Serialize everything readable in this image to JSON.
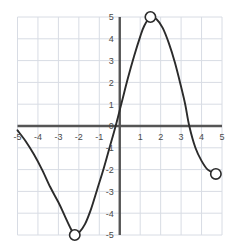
{
  "chart_data": {
    "type": "line",
    "title": "",
    "xlabel": "",
    "ylabel": "",
    "xlim": [
      -5,
      5
    ],
    "ylim": [
      -5,
      5
    ],
    "grid": true,
    "legend": null,
    "x_ticks": [
      -5,
      -4,
      -3,
      -2,
      -1,
      0,
      1,
      2,
      3,
      4,
      5
    ],
    "x_tick_labels": [
      "-5",
      "-4",
      "-3",
      "-2",
      "-1",
      "0",
      "1",
      "2",
      "3",
      "4",
      "5"
    ],
    "y_ticks": [
      -5,
      -4,
      -3,
      -2,
      -1,
      0,
      1,
      2,
      3,
      4,
      5
    ],
    "y_tick_labels": [
      "-5",
      "-4",
      "-3",
      "-2",
      "-1",
      "0",
      "1",
      "2",
      "3",
      "4",
      "5"
    ],
    "y_tick_labels_shown": [
      "5",
      "4",
      "3",
      "2",
      "1",
      "0",
      "-1",
      "-2",
      "-3",
      "-4",
      "-5"
    ],
    "axis_color": "#555555",
    "grid_color": "#d8dce4",
    "curve_color": "#2b2b2b",
    "marker_fill": "#ffffff",
    "marker_edge": "#2b2b2b",
    "series": [
      {
        "name": "curve",
        "points": [
          [
            -5.0,
            -0.2
          ],
          [
            -4.6,
            -0.7
          ],
          [
            -4.2,
            -1.3
          ],
          [
            -3.8,
            -2.0
          ],
          [
            -3.4,
            -2.8
          ],
          [
            -3.0,
            -3.5
          ],
          [
            -2.7,
            -4.1
          ],
          [
            -2.4,
            -4.7
          ],
          [
            -2.2,
            -5.0
          ],
          [
            -2.0,
            -4.9
          ],
          [
            -1.7,
            -4.5
          ],
          [
            -1.4,
            -3.8
          ],
          [
            -1.1,
            -2.9
          ],
          [
            -0.8,
            -2.0
          ],
          [
            -0.5,
            -1.0
          ],
          [
            -0.2,
            0.0
          ],
          [
            0.1,
            1.1
          ],
          [
            0.4,
            2.2
          ],
          [
            0.7,
            3.2
          ],
          [
            1.0,
            4.1
          ],
          [
            1.2,
            4.6
          ],
          [
            1.5,
            5.0
          ],
          [
            1.8,
            4.9
          ],
          [
            2.1,
            4.5
          ],
          [
            2.4,
            3.8
          ],
          [
            2.7,
            2.9
          ],
          [
            3.0,
            1.8
          ],
          [
            3.2,
            1.0
          ],
          [
            3.4,
            0.0
          ],
          [
            3.7,
            -1.0
          ],
          [
            4.0,
            -1.6
          ],
          [
            4.3,
            -2.0
          ],
          [
            4.7,
            -2.2
          ]
        ]
      }
    ],
    "markers": [
      {
        "name": "local-maximum",
        "x": 1.5,
        "y": 5.0,
        "style": "open-circle"
      },
      {
        "name": "local-minimum",
        "x": -2.2,
        "y": -5.0,
        "style": "open-circle"
      },
      {
        "name": "right-endpoint",
        "x": 4.7,
        "y": -2.2,
        "style": "open-circle"
      }
    ]
  }
}
